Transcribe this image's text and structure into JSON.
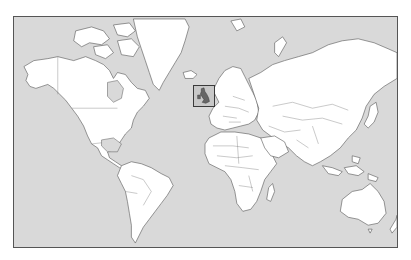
{
  "map": {
    "projection": "mercator",
    "style": "outline world map, white land on grey ocean",
    "colors": {
      "ocean": "#d9d9d9",
      "land": "#ffffff",
      "outline": "#555555",
      "highlight_box": "#3a3a3a",
      "highlight_land": "#666666"
    },
    "frame": {
      "x": 13,
      "y": 16,
      "width": 385,
      "height": 232
    },
    "highlight": {
      "region": "United Kingdom",
      "box": {
        "x": 192,
        "y": 84,
        "width": 22,
        "height": 22
      }
    },
    "continents": [
      "North America",
      "Greenland",
      "South America",
      "Europe",
      "Africa",
      "Asia",
      "Australia"
    ]
  }
}
